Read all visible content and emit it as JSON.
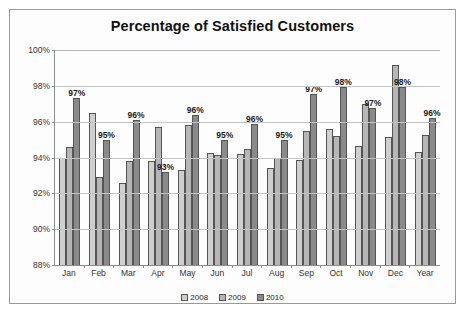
{
  "chart_data": {
    "type": "bar",
    "title": "Percentage of Satisfied Customers",
    "xlabel": "",
    "ylabel": "",
    "ylim": [
      88,
      100
    ],
    "ytick_labels": [
      "100%",
      "98%",
      "96%",
      "94%",
      "92%",
      "90%",
      "88%"
    ],
    "ytick_values": [
      100,
      98,
      96,
      94,
      92,
      90,
      88
    ],
    "grid": true,
    "legend_position": "bottom",
    "categories": [
      "Jan",
      "Feb",
      "Mar",
      "Apr",
      "May",
      "Jun",
      "Jul",
      "Aug",
      "Sep",
      "Oct",
      "Nov",
      "Dec",
      "Year"
    ],
    "series": [
      {
        "name": "2008",
        "color": "#cfcfcf",
        "values": [
          94.0,
          96.5,
          92.6,
          93.8,
          93.3,
          94.25,
          94.2,
          93.4,
          93.85,
          95.6,
          94.65,
          95.15,
          94.3
        ]
      },
      {
        "name": "2009",
        "color": "#b6b6b6",
        "values": [
          94.6,
          92.9,
          93.8,
          95.7,
          95.8,
          94.15,
          94.5,
          94.0,
          95.5,
          95.2,
          97.0,
          99.15,
          95.25
        ]
      },
      {
        "name": "2010",
        "color": "#8a8a8a",
        "values": [
          97.3,
          95.0,
          96.1,
          93.2,
          96.4,
          95.0,
          95.85,
          95.0,
          97.55,
          97.95,
          96.75,
          97.95,
          96.2
        ]
      }
    ],
    "data_labels": [
      "97%",
      "95%",
      "96%",
      "93%",
      "96%",
      "95%",
      "96%",
      "95%",
      "97%",
      "98%",
      "97%",
      "98%",
      "96%"
    ],
    "data_label_series": "2010"
  }
}
